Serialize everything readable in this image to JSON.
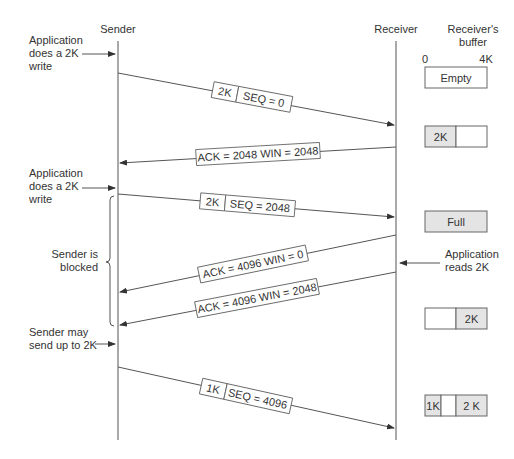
{
  "header": {
    "sender_label": "Sender",
    "receiver_label": "Receiver",
    "buffer_title_line1": "Receiver's",
    "buffer_title_line2": "buffer",
    "buffer_scale_min": "0",
    "buffer_scale_max": "4K"
  },
  "annotations": {
    "write1": [
      "Application",
      "does a 2K",
      "write"
    ],
    "write2": [
      "Application",
      "does a 2K",
      "write"
    ],
    "blocked": [
      "Sender is",
      "blocked"
    ],
    "may_send": [
      "Sender may",
      "send up to 2K"
    ],
    "app_reads": [
      "Application",
      "reads 2K"
    ]
  },
  "messages": [
    {
      "direction": "sender-to-receiver",
      "size": "2K",
      "label": "SEQ = 0"
    },
    {
      "direction": "receiver-to-sender",
      "label": "ACK = 2048 WIN = 2048"
    },
    {
      "direction": "sender-to-receiver",
      "size": "2K",
      "label": "SEQ = 2048"
    },
    {
      "direction": "receiver-to-sender",
      "label": "ACK = 4096 WIN = 0"
    },
    {
      "direction": "receiver-to-sender",
      "label": "ACK = 4096 WIN = 2048"
    },
    {
      "direction": "sender-to-receiver",
      "size": "1K",
      "label": "SEQ = 4096"
    }
  ],
  "buffers": [
    {
      "state": "Empty"
    },
    {
      "state": "2K"
    },
    {
      "state": "Full"
    },
    {
      "state": "2K"
    },
    {
      "left": "1K",
      "right": "2 K"
    }
  ],
  "colors": {
    "line": "#555555",
    "text": "#333333",
    "buffer_fill": "#e4e4e4"
  }
}
